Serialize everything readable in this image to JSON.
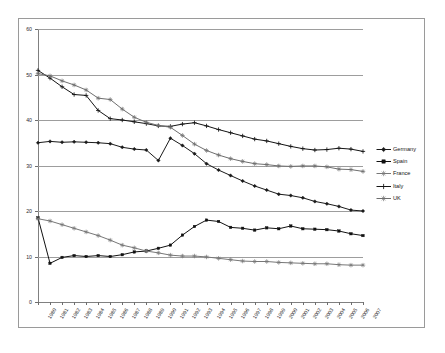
{
  "chart_data": {
    "type": "line",
    "title": "",
    "subtitle": "",
    "xlabel": "",
    "ylabel": "",
    "xlim": [
      1980,
      2007
    ],
    "ylim": [
      0,
      60
    ],
    "yticks": [
      0,
      10,
      20,
      30,
      40,
      50,
      60
    ],
    "grid": true,
    "grid_axis": "y",
    "legend_position": "right",
    "categories": [
      "1980",
      "1981",
      "1982",
      "1983",
      "1984",
      "1985",
      "1986",
      "1987",
      "1988",
      "1989",
      "1990",
      "1991",
      "1992",
      "1993",
      "1994",
      "1995",
      "1996",
      "1997",
      "1998",
      "1999",
      "2000",
      "2001",
      "2002",
      "2003",
      "2004",
      "2005",
      "2006",
      "2007"
    ],
    "series": [
      {
        "name": "Germany",
        "marker": "diamond",
        "color": "#1a1a1a",
        "values": [
          35.0,
          35.3,
          35.1,
          35.2,
          35.1,
          35.0,
          34.8,
          34.0,
          33.6,
          33.4,
          31.1,
          36.0,
          34.4,
          32.6,
          30.4,
          29.0,
          27.8,
          26.6,
          25.5,
          24.6,
          23.7,
          23.4,
          22.9,
          22.1,
          21.6,
          21.0,
          20.2,
          20.0
        ]
      },
      {
        "name": "Spain",
        "marker": "square",
        "color": "#111111",
        "values": [
          18.5,
          8.5,
          9.8,
          10.2,
          10.0,
          10.2,
          10.0,
          10.4,
          11.0,
          11.2,
          11.8,
          12.5,
          14.7,
          16.6,
          18.0,
          17.7,
          16.4,
          16.2,
          15.8,
          16.3,
          16.1,
          16.7,
          16.1,
          16.0,
          15.9,
          15.6,
          15.0,
          14.6
        ]
      },
      {
        "name": "France",
        "marker": "star",
        "color": "#777777",
        "values": [
          18.3,
          17.8,
          17.0,
          16.2,
          15.4,
          14.6,
          13.6,
          12.5,
          11.9,
          11.2,
          10.8,
          10.3,
          10.1,
          10.1,
          9.9,
          9.6,
          9.3,
          9.0,
          8.9,
          8.9,
          8.7,
          8.6,
          8.5,
          8.4,
          8.4,
          8.2,
          8.1,
          8.1
        ]
      },
      {
        "name": "Italy",
        "marker": "plus",
        "color": "#141414",
        "values": [
          50.9,
          49.2,
          47.3,
          45.6,
          45.4,
          42.1,
          40.3,
          40.0,
          39.6,
          39.2,
          38.7,
          38.6,
          39.1,
          39.4,
          38.7,
          37.9,
          37.2,
          36.5,
          35.8,
          35.4,
          34.8,
          34.2,
          33.7,
          33.4,
          33.5,
          33.8,
          33.6,
          33.1
        ]
      },
      {
        "name": "UK",
        "marker": "star",
        "color": "#6e6e6e",
        "values": [
          50.2,
          49.7,
          48.6,
          47.7,
          46.6,
          44.8,
          44.5,
          42.4,
          40.6,
          39.5,
          38.8,
          38.4,
          36.6,
          34.7,
          33.3,
          32.3,
          31.5,
          30.9,
          30.4,
          30.2,
          29.9,
          29.8,
          29.9,
          29.9,
          29.7,
          29.2,
          29.1,
          28.7
        ]
      }
    ]
  },
  "legend": {
    "items": [
      {
        "label": "Germany"
      },
      {
        "label": "Spain"
      },
      {
        "label": "France"
      },
      {
        "label": "Italy"
      },
      {
        "label": "UK"
      }
    ]
  }
}
